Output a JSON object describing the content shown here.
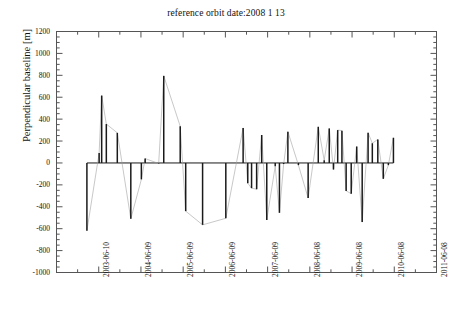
{
  "chart_data": {
    "type": "bar",
    "title": "reference orbit date:2008 1 13",
    "xlabel": "",
    "ylabel": "Perpendicular baseline [m]",
    "ylim": [
      -1000,
      1200
    ],
    "ytick_values": [
      1200,
      1000,
      800,
      600,
      400,
      200,
      0,
      -200,
      -400,
      -600,
      -800,
      -1000
    ],
    "ytick_labels": [
      "1200",
      "1000",
      "800",
      "600",
      "400",
      "200",
      "0",
      "-200",
      "-400",
      "-600",
      "-800",
      "-1000"
    ],
    "xlim": [
      "2002-06-10",
      "2011-06-08"
    ],
    "xtick_labels": [
      "2003-06-10",
      "2004-06-09",
      "2005-06-09",
      "2006-06-09",
      "2007-06-09",
      "2008-06-08",
      "2009-06-08",
      "2010-06-08",
      "2011-06-08"
    ],
    "grid": false,
    "legend": null,
    "series_note": "Perpendicular baseline stems per SAR acquisition, connected in acquisition order by thin lines",
    "bar_color": "#1a1a1a",
    "connector_color": "#9a9a9a",
    "axis_color": "#555555",
    "x": [
      2003.16,
      2003.45,
      2003.51,
      2003.62,
      2003.88,
      2004.2,
      2004.45,
      2004.54,
      2004.86,
      2004.98,
      2005.37,
      2005.5,
      2005.9,
      2006.45,
      2006.86,
      2006.97,
      2007.06,
      2007.18,
      2007.3,
      2007.42,
      2007.62,
      2007.72,
      2007.82,
      2007.92,
      2008.17,
      2008.4,
      2008.64,
      2008.78,
      2008.9,
      2009.0,
      2009.1,
      2009.2,
      2009.3,
      2009.42,
      2009.55,
      2009.68,
      2009.82,
      2009.92,
      2010.05,
      2010.18,
      2010.3,
      2010.42
    ],
    "values": [
      -620,
      90,
      615,
      355,
      275,
      -510,
      -150,
      40,
      -5,
      795,
      335,
      -440,
      -565,
      -505,
      320,
      -185,
      -230,
      -240,
      255,
      -520,
      -30,
      -455,
      -10,
      285,
      -20,
      -320,
      330,
      25,
      315,
      -60,
      300,
      295,
      -255,
      -280,
      150,
      -540,
      275,
      180,
      215,
      -145,
      -20,
      230
    ]
  }
}
